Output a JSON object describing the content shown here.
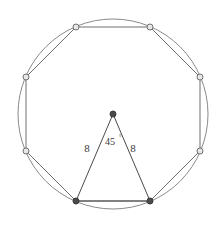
{
  "figure": {
    "background_color": "#ffffff"
  },
  "chart_data": {
    "type": "diagram",
    "shapes": [
      {
        "name": "circumscribed-circle",
        "kind": "circle",
        "center": [
          113,
          114
        ],
        "radius": 95,
        "stroke": "#8a8a8a",
        "stroke_width": 1,
        "fill": "none"
      },
      {
        "name": "regular-octagon",
        "kind": "polygon",
        "sides": 8,
        "stroke": "#6e6e6e",
        "stroke_width": 1,
        "fill": "none",
        "vertices": [
          [
            76,
            27
          ],
          [
            150,
            27
          ],
          [
            200,
            77
          ],
          [
            200,
            151
          ],
          [
            150,
            201
          ],
          [
            76,
            201
          ],
          [
            26,
            151
          ],
          [
            26,
            77
          ]
        ]
      },
      {
        "name": "central-triangle",
        "kind": "polygon",
        "stroke": "#4a4a4a",
        "stroke_width": 1,
        "fill": "none",
        "vertices": [
          [
            113,
            114
          ],
          [
            76,
            201
          ],
          [
            150,
            201
          ]
        ]
      }
    ],
    "points": [
      {
        "name": "octagon-vertex-top-left",
        "x": 76,
        "y": 27,
        "style": "open",
        "fill": "#e8e8e8",
        "stroke": "#707070",
        "r": 3
      },
      {
        "name": "octagon-vertex-top-right",
        "x": 150,
        "y": 27,
        "style": "open",
        "fill": "#e8e8e8",
        "stroke": "#707070",
        "r": 3
      },
      {
        "name": "octagon-vertex-right-upper",
        "x": 200,
        "y": 77,
        "style": "open",
        "fill": "#e8e8e8",
        "stroke": "#707070",
        "r": 3
      },
      {
        "name": "octagon-vertex-right-lower",
        "x": 200,
        "y": 151,
        "style": "open",
        "fill": "#e8e8e8",
        "stroke": "#707070",
        "r": 3
      },
      {
        "name": "octagon-vertex-bottom-right",
        "x": 150,
        "y": 201,
        "style": "filled",
        "fill": "#4a4a4a",
        "stroke": "#3a3a3a",
        "r": 3
      },
      {
        "name": "octagon-vertex-bottom-left",
        "x": 76,
        "y": 201,
        "style": "filled",
        "fill": "#4a4a4a",
        "stroke": "#3a3a3a",
        "r": 3
      },
      {
        "name": "octagon-vertex-left-lower",
        "x": 26,
        "y": 151,
        "style": "open",
        "fill": "#e8e8e8",
        "stroke": "#707070",
        "r": 3
      },
      {
        "name": "octagon-vertex-left-upper",
        "x": 26,
        "y": 77,
        "style": "open",
        "fill": "#e8e8e8",
        "stroke": "#707070",
        "r": 3
      },
      {
        "name": "circle-center-apex",
        "x": 113,
        "y": 114,
        "style": "filled",
        "fill": "#4a4a4a",
        "stroke": "#3a3a3a",
        "r": 3
      }
    ],
    "annotations": [
      {
        "name": "left-side-label",
        "text": "8",
        "x": 87,
        "y": 152
      },
      {
        "name": "right-side-label",
        "text": "8",
        "x": 133,
        "y": 152
      },
      {
        "name": "angle-label",
        "text": "45",
        "x": 105,
        "y": 145
      },
      {
        "name": "degree-symbol",
        "text": "°",
        "x": 120,
        "y": 140
      }
    ]
  },
  "labels": {
    "left_side": "8",
    "right_side": "8",
    "angle_value": "45",
    "degree_symbol": "°",
    "angle_full": "45°"
  },
  "colors": {
    "circle_stroke": "#8a8a8a",
    "octagon_stroke": "#6e6e6e",
    "triangle_stroke": "#4a4a4a",
    "open_vertex_fill": "#e8e8e8",
    "open_vertex_stroke": "#707070",
    "filled_vertex_fill": "#4a4a4a",
    "text_color": "#3a3a3a",
    "background": "#ffffff"
  }
}
